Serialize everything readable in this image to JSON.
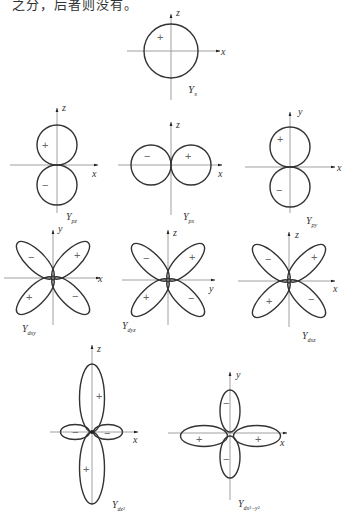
{
  "top_text": "之分，后者则没有。",
  "figure": {
    "orbitals": [
      {
        "id": "s",
        "label_main": "Y",
        "label_sub": "s",
        "axes": [
          "x",
          "z"
        ],
        "signs": [
          "+"
        ]
      },
      {
        "id": "pz",
        "label_main": "Y",
        "label_sub": "pz",
        "axes": [
          "x",
          "z"
        ],
        "signs": [
          "+",
          "−"
        ]
      },
      {
        "id": "px",
        "label_main": "Y",
        "label_sub": "px",
        "axes": [
          "x",
          "z"
        ],
        "signs": [
          "−",
          "+"
        ]
      },
      {
        "id": "py",
        "label_main": "Y",
        "label_sub": "py",
        "axes": [
          "x",
          "y"
        ],
        "signs": [
          "+",
          "−"
        ]
      },
      {
        "id": "dxy",
        "label_main": "Y",
        "label_sub": "dxy",
        "axes": [
          "x",
          "y"
        ],
        "signs": [
          "−",
          "+",
          "+",
          "−"
        ]
      },
      {
        "id": "dyz",
        "label_main": "Y",
        "label_sub": "dyz",
        "axes": [
          "y",
          "z"
        ],
        "signs": [
          "−",
          "+",
          "+",
          "−"
        ]
      },
      {
        "id": "dxz",
        "label_main": "Y",
        "label_sub": "dxz",
        "axes": [
          "x",
          "z"
        ],
        "signs": [
          "−",
          "+",
          "+",
          "−"
        ]
      },
      {
        "id": "dz2",
        "label_main": "Y",
        "label_sub": "dz²",
        "axes": [
          "x",
          "z"
        ],
        "signs": [
          "+",
          "−",
          "−",
          "+"
        ]
      },
      {
        "id": "dx2y2",
        "label_main": "Y",
        "label_sub": "dx²−y²",
        "axes": [
          "x",
          "y"
        ],
        "signs": [
          "−",
          "+",
          "+",
          "−"
        ]
      }
    ],
    "axis_labels": {
      "x": "x",
      "y": "y",
      "z": "z"
    },
    "signs": {
      "plus": "+",
      "minus": "−"
    }
  }
}
